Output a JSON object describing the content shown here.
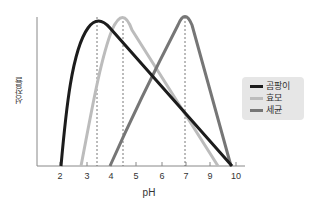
{
  "chart_data": {
    "type": "line",
    "title": "",
    "xlabel": "pH",
    "ylabel": "성장률",
    "x_ticks": [
      "2",
      "3",
      "4",
      "5",
      "6",
      "7",
      "9",
      "10"
    ],
    "grid": false,
    "legend_position": "right",
    "reference_lines_x": [
      3.5,
      4.5,
      7
    ],
    "series": [
      {
        "name": "곰팡이",
        "color": "#1c1c1c",
        "points": [
          [
            2,
            0
          ],
          [
            2.3,
            55
          ],
          [
            2.8,
            88
          ],
          [
            3.5,
            100
          ],
          [
            4.5,
            85
          ],
          [
            6,
            60
          ],
          [
            7,
            37
          ],
          [
            8.5,
            17
          ],
          [
            10,
            0
          ]
        ]
      },
      {
        "name": "효모",
        "color": "#bcbcbc",
        "points": [
          [
            2.8,
            0
          ],
          [
            3.5,
            50
          ],
          [
            4.0,
            85
          ],
          [
            4.5,
            100
          ],
          [
            5.5,
            80
          ],
          [
            7,
            40
          ],
          [
            8.5,
            12
          ],
          [
            9.3,
            0
          ]
        ]
      },
      {
        "name": "세균",
        "color": "#767676",
        "points": [
          [
            4,
            0
          ],
          [
            5,
            35
          ],
          [
            6,
            70
          ],
          [
            6.6,
            95
          ],
          [
            7,
            100
          ],
          [
            7.4,
            95
          ],
          [
            8.5,
            50
          ],
          [
            10,
            0
          ]
        ]
      }
    ]
  },
  "legend": {
    "items": [
      {
        "label": "곰팡이",
        "color": "#1c1c1c"
      },
      {
        "label": "효모",
        "color": "#bcbcbc"
      },
      {
        "label": "세균",
        "color": "#767676"
      }
    ]
  },
  "axes": {
    "xlabel": "pH",
    "ylabel": "성장률",
    "ticks": [
      {
        "label": "2",
        "x": 60
      },
      {
        "label": "3",
        "x": 87
      },
      {
        "label": "4",
        "x": 111
      },
      {
        "label": "5",
        "x": 136
      },
      {
        "label": "6",
        "x": 162
      },
      {
        "label": "7",
        "x": 186
      },
      {
        "label": "9",
        "x": 210
      },
      {
        "label": "10",
        "x": 236
      }
    ]
  }
}
